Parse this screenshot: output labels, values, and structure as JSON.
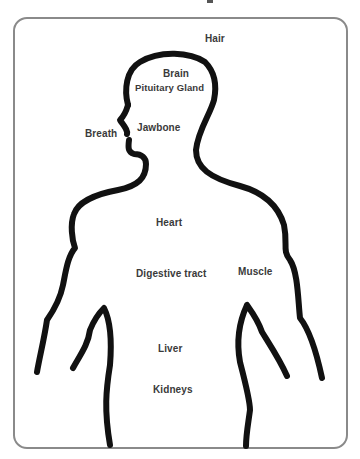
{
  "diagram": {
    "title_fragment": "",
    "type": "labeled body outline",
    "colors": {
      "frame_border": "#8a8a8a",
      "outline": "#111111",
      "label_text": "#3a3a3a",
      "background": "#ffffff"
    },
    "labels": {
      "hair": "Hair",
      "brain": "Brain",
      "pituitary_gland": "Pituitary Gland",
      "breath": "Breath",
      "jawbone": "Jawbone",
      "heart": "Heart",
      "digestive_tract": "Digestive tract",
      "muscle": "Muscle",
      "liver": "Liver",
      "kidneys": "Kidneys"
    }
  }
}
